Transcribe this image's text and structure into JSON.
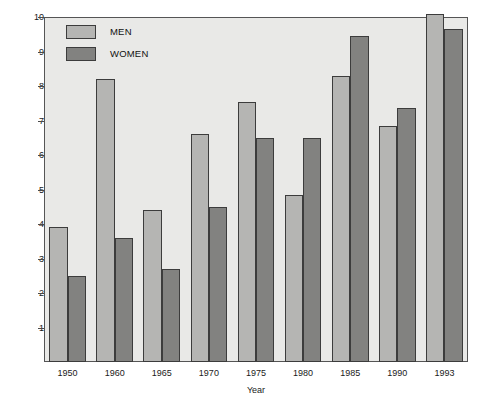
{
  "chart_data": {
    "type": "bar",
    "title": "",
    "xlabel": "Year",
    "ylabel": "Unemployment Rate (Percent)",
    "categories": [
      "1950",
      "1960",
      "1965",
      "1970",
      "1975",
      "1980",
      "1985",
      "1990",
      "1993"
    ],
    "series": [
      {
        "name": "MEN",
        "color": "#b5b5b3",
        "values": [
          3.9,
          8.2,
          4.4,
          6.6,
          7.55,
          4.85,
          8.3,
          6.85,
          10.1
        ]
      },
      {
        "name": "WOMEN",
        "color": "#828280",
        "values": [
          2.5,
          3.6,
          2.7,
          4.5,
          6.5,
          6.5,
          9.45,
          7.35,
          9.65
        ]
      }
    ],
    "ylim": [
      0,
      10
    ],
    "yticks": [
      1,
      2,
      3,
      4,
      5,
      6,
      7,
      8,
      9,
      10
    ],
    "ytick_labels": [
      "1",
      "2",
      "3",
      "4",
      "5",
      "6",
      "7",
      "8",
      "9",
      "10"
    ],
    "grid": false,
    "legend_position": "top-left-inside",
    "plot_background": "#e9e9e7",
    "page_background": "#ffffff",
    "axis_color": "#555555",
    "bar_outline_color": "#3c3c3c"
  }
}
